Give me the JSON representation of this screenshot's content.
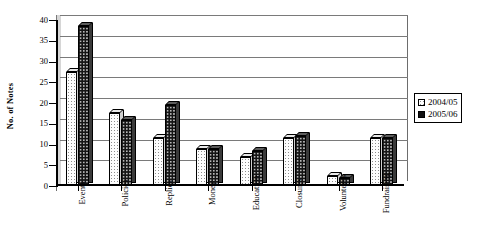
{
  "chart_data": {
    "type": "bar",
    "title": "",
    "xlabel": "",
    "ylabel": "No. of Notes",
    "ylim": [
      0,
      40
    ],
    "ytick_step": 5,
    "yticks": [
      "40",
      "35",
      "30",
      "25",
      "20",
      "15",
      "10",
      "5",
      "0"
    ],
    "grid": true,
    "legend_position": "right",
    "categories": [
      "Events",
      "Policies",
      "Replies",
      "Money",
      "Education",
      "Closures",
      "Volunteers",
      "Fundraising"
    ],
    "series": [
      {
        "name": "2004/05",
        "swatch": "light-dotted",
        "values": [
          27.5,
          17.5,
          11.5,
          9,
          7,
          11.5,
          2.5,
          11.5
        ]
      },
      {
        "name": "2005/06",
        "swatch": "black",
        "values": [
          38.5,
          16,
          19.5,
          9,
          8.5,
          12,
          2,
          11.5
        ]
      }
    ]
  },
  "legend": {
    "entries": [
      {
        "label": "2004/05"
      },
      {
        "label": "2005/06"
      }
    ]
  }
}
